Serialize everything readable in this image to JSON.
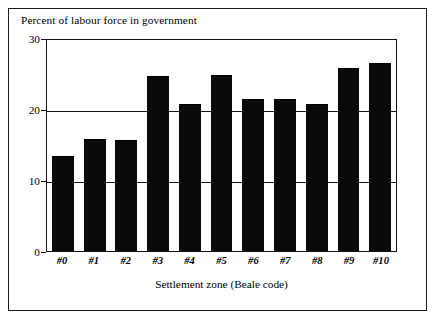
{
  "chart_data": {
    "type": "bar",
    "title": "Percent of labour force in government",
    "xlabel": "Settlement zone (Beale code)",
    "ylabel": "Percent of labour force in government",
    "categories": [
      "#0",
      "#1",
      "#2",
      "#3",
      "#4",
      "#5",
      "#6",
      "#7",
      "#8",
      "#9",
      "#10"
    ],
    "values": [
      13.3,
      15.7,
      15.5,
      24.5,
      20.6,
      24.6,
      21.3,
      21.3,
      20.5,
      25.7,
      26.3
    ],
    "ylim": [
      0,
      30
    ],
    "yticks": [
      0,
      10,
      20,
      30
    ],
    "ytick_labels": [
      "0",
      "10",
      "20",
      "30"
    ],
    "grid": true,
    "legend": "none",
    "bar_color": "#0a0a0a",
    "background_color": "#ffffff",
    "frame_color": "#1a1a1a"
  },
  "axes": {
    "y_ticks": [
      {
        "label": "30",
        "value": 30
      },
      {
        "label": "20",
        "value": 20
      },
      {
        "label": "10",
        "value": 10
      },
      {
        "label": "0",
        "value": 0
      }
    ],
    "x_ticks": [
      {
        "label": "#0"
      },
      {
        "label": "#1"
      },
      {
        "label": "#2"
      },
      {
        "label": "#3"
      },
      {
        "label": "#4"
      },
      {
        "label": "#5"
      },
      {
        "label": "#6"
      },
      {
        "label": "#7"
      },
      {
        "label": "#8"
      },
      {
        "label": "#9"
      },
      {
        "label": "#10"
      }
    ]
  }
}
